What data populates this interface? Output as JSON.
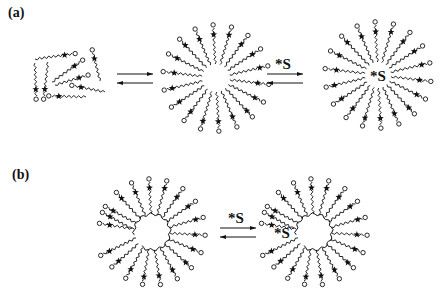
{
  "panels": [
    {
      "label": "(a)",
      "label_pos": [
        8,
        5
      ],
      "stages": [
        {
          "type": "free_monomers",
          "center": [
            70,
            80
          ]
        },
        {
          "type": "arrows",
          "center": [
            135,
            78
          ],
          "label": ""
        },
        {
          "type": "micelle",
          "center": [
            216,
            78
          ],
          "core_radius": 14,
          "chain_length": 36,
          "n_chains": 18,
          "core_text": "",
          "gap": false
        },
        {
          "type": "arrows",
          "center": [
            285,
            78
          ],
          "label": "*S"
        },
        {
          "type": "micelle",
          "center": [
            378,
            75
          ],
          "core_radius": 13,
          "chain_length": 37,
          "n_chains": 18,
          "core_text": "*S",
          "gap": false
        }
      ]
    },
    {
      "label": "(b)",
      "label_pos": [
        12,
        170
      ],
      "stages": [
        {
          "type": "micelle",
          "center": [
            152,
            232
          ],
          "core_radius": 18,
          "chain_length": 32,
          "n_chains": 17,
          "core_text": "",
          "gap": true
        },
        {
          "type": "arrows",
          "center": [
            238,
            232
          ],
          "label": "*S"
        },
        {
          "type": "micelle",
          "center": [
            314,
            232
          ],
          "core_radius": 18,
          "chain_length": 32,
          "n_chains": 17,
          "core_text": "*S",
          "gap": true
        }
      ]
    }
  ],
  "legend_symbols": {
    "head_group": "open-circle",
    "probe_label": "star",
    "solubilizate": "*S"
  },
  "colors": {
    "ink": "#111111",
    "background": "#ffffff"
  }
}
